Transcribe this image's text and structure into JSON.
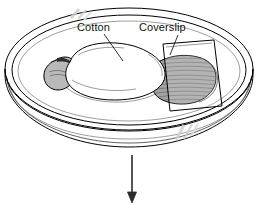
{
  "figure": {
    "background_color": "#ffffff",
    "ink_color": "#000000",
    "width": 258,
    "height": 206
  },
  "labels": {
    "cotton": "Cotton",
    "coverslip": "Coverslip"
  },
  "parts": {
    "dish_name": "petri-dish",
    "cotton_name": "cotton-wad",
    "coverslip_name": "coverslip",
    "specimen_head_name": "specimen-head",
    "specimen_tail_name": "specimen-tail",
    "arrow_name": "process-arrow"
  },
  "colors": {
    "outline": "#000000",
    "cotton_fill": "#ffffff",
    "head_fill": "#b5b5b5",
    "tail_fill": "#9e9e9e",
    "rim_glint": "#d8d8d8",
    "coverslip_fill": "#ffffff",
    "arrow": "#2b2b2b"
  },
  "arrow": {
    "direction": "down",
    "x": 132,
    "y_start": 155,
    "y_end": 203
  }
}
